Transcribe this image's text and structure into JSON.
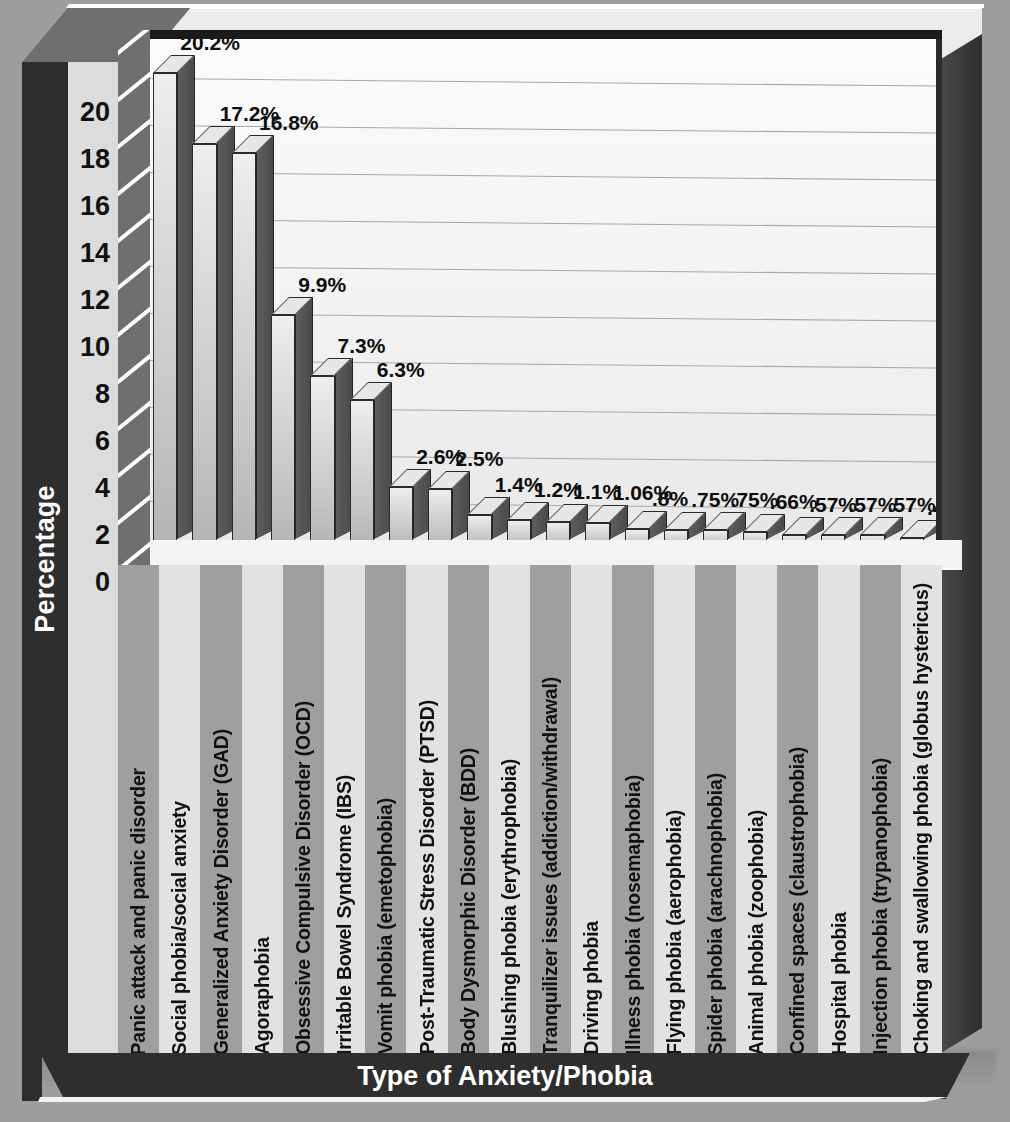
{
  "chart_data": {
    "type": "bar",
    "title": "",
    "xlabel": "Type of Anxiety/Phobia",
    "ylabel": "Percentage",
    "ylim": [
      0,
      20
    ],
    "ytick_labels": [
      "20",
      "18",
      "16",
      "14",
      "12",
      "10",
      "8",
      "6",
      "4",
      "2",
      "0"
    ],
    "ytick_values": [
      20,
      18,
      16,
      14,
      12,
      10,
      8,
      6,
      4,
      2,
      0
    ],
    "grid": true,
    "legend": "none",
    "categories": [
      "Panic attack and panic disorder",
      "Social phobia/social anxiety",
      "Generalized Anxiety Disorder (GAD)",
      "Agoraphobia",
      "Obsessive Compulsive Disorder (OCD)",
      "Irritable Bowel Syndrome (IBS)",
      "Vomit phobia (emetophobia)",
      "Post-Traumatic Stress Disorder (PTSD)",
      "Body Dysmorphic Disorder (BDD)",
      "Blushing phobia (erythrophobia)",
      "Tranquilizer issues (addiction/withdrawal)",
      "Driving phobia",
      "Illness phobia (nosemaphobia)",
      "Flying phobia (aerophobia)",
      "Spider phobia (arachnophobia)",
      "Animal phobia (zoophobia)",
      "Confined spaces (claustrophobia)",
      "Hospital phobia",
      "Injection phobia (trypanophobia)",
      "Choking and swallowing phobia (globus hystericus)"
    ],
    "values": [
      20.2,
      17.2,
      16.8,
      9.9,
      7.3,
      6.3,
      2.6,
      2.5,
      1.4,
      1.2,
      1.1,
      1.06,
      0.8,
      0.75,
      0.75,
      0.66,
      0.57,
      0.57,
      0.57,
      0.44
    ],
    "value_labels": [
      "20.2%",
      "17.2%",
      "16.8%",
      "9.9%",
      "7.3%",
      "6.3%",
      "2.6%",
      "2.5%",
      "1.4%",
      "1.2%",
      "1.1%",
      "1.06%",
      ".8%",
      ".75%",
      ".75%",
      ".66%",
      ".57%",
      ".57%",
      ".57%",
      ".44%"
    ]
  },
  "colors": {
    "page_background": "#9d9d9d",
    "frame_dark": "#2e2e2e",
    "bar_front": "#d2d2d2",
    "bar_side": "#4f4f4f",
    "bar_top": "#e7e7e7",
    "plot_background": "#f4f4f4",
    "gridline": "#a9a9a9",
    "label_band_light": "#e2e2e2",
    "label_band_dark": "#9f9f9f",
    "axis_title_text": "#ffffff",
    "tick_text": "#111111"
  }
}
